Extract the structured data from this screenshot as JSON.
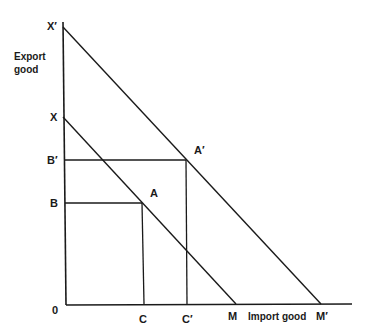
{
  "diagram": {
    "y_axis_label_line1": "Export",
    "y_axis_label_line2": "good",
    "x_axis_label": "Import good",
    "origin_label": "0",
    "points": {
      "x_prime": "X′",
      "x": "X",
      "b_prime": "B′",
      "b": "B",
      "a": "A",
      "a_prime": "A′",
      "c": "C",
      "c_prime": "C′",
      "m": "M",
      "m_prime": "M′"
    },
    "lines": [
      {
        "name": "budget-line-XM",
        "from": "X",
        "to": "M"
      },
      {
        "name": "budget-line-X'M'",
        "from": "X′",
        "to": "M′"
      }
    ],
    "guides": [
      {
        "name": "B-to-A",
        "from": "B",
        "to": "A"
      },
      {
        "name": "A-to-C",
        "from": "A",
        "to": "C"
      },
      {
        "name": "B'-to-A'",
        "from": "B′",
        "to": "A′"
      },
      {
        "name": "A'-to-C'",
        "from": "A′",
        "to": "C′"
      }
    ]
  }
}
